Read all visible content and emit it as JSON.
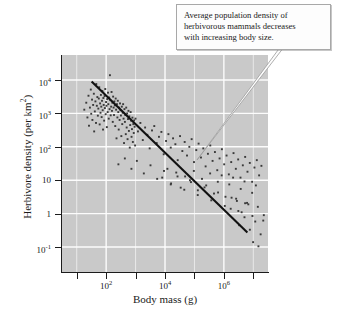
{
  "figure": {
    "panel_color": "#c9c9c9",
    "grid_color": "#ffffff",
    "point_color": "#3a3a3a",
    "line_color": "#111111"
  },
  "callout": {
    "text": "Average population density of herbivorous mammals decreases with increasing body size.",
    "line1": "Average population density of",
    "line2": "herbivorous mammals decreases",
    "line3": "with increasing body size."
  },
  "chart_data": {
    "type": "scatter",
    "title": "",
    "xlabel": "Body mass (g)",
    "ylabel": "Herbivore density (per km²)",
    "xscale": "log",
    "yscale": "log",
    "xlim": [
      3.16,
      31600000
    ],
    "ylim": [
      0.0178,
      56200
    ],
    "grid": true,
    "legend": null,
    "xticks": [
      100,
      10000,
      1000000
    ],
    "xticklabels": [
      "10²",
      "10⁴",
      "10⁶"
    ],
    "xtick_exponents": [
      "2",
      "4",
      "6"
    ],
    "yticks": [
      10000,
      1000,
      100,
      10,
      1,
      0.1
    ],
    "yticklabels": [
      "10⁴",
      "10³",
      "10²",
      "10",
      "1",
      "10⁻¹"
    ],
    "ytick_mantissas": [
      "10",
      "10",
      "10",
      "10",
      "1",
      "10"
    ],
    "ytick_exponents": [
      "4",
      "3",
      "2",
      "",
      "",
      "-1"
    ],
    "annotations": [
      {
        "text": "Average population density of herbivorous mammals decreases with increasing body size.",
        "type": "callout-box",
        "pointer_target_x": 300000,
        "pointer_target_y": 30
      }
    ],
    "trendline": {
      "type": "power-law regression",
      "x_start": 32,
      "y_start": 9000,
      "x_end": 6300000,
      "y_end": 0.27,
      "slope_log10": -0.75
    },
    "n_points": 204,
    "points": [
      [
        18,
        1300
      ],
      [
        21,
        2100
      ],
      [
        23,
        760
      ],
      [
        25,
        3400
      ],
      [
        26,
        430
      ],
      [
        28,
        1500
      ],
      [
        30,
        5200
      ],
      [
        31,
        980
      ],
      [
        33,
        2600
      ],
      [
        34,
        640
      ],
      [
        36,
        1800
      ],
      [
        38,
        3900
      ],
      [
        39,
        290
      ],
      [
        41,
        1150
      ],
      [
        43,
        2300
      ],
      [
        45,
        520
      ],
      [
        46,
        7600
      ],
      [
        48,
        1700
      ],
      [
        50,
        3100
      ],
      [
        52,
        860
      ],
      [
        54,
        1400
      ],
      [
        56,
        2800
      ],
      [
        58,
        6100
      ],
      [
        60,
        470
      ],
      [
        62,
        2000
      ],
      [
        64,
        1050
      ],
      [
        66,
        3600
      ],
      [
        68,
        1600
      ],
      [
        70,
        780
      ],
      [
        72,
        2400
      ],
      [
        74,
        4700
      ],
      [
        76,
        1250
      ],
      [
        78,
        330
      ],
      [
        80,
        2900
      ],
      [
        82,
        1800
      ],
      [
        85,
        610
      ],
      [
        88,
        3300
      ],
      [
        90,
        1450
      ],
      [
        93,
        5400
      ],
      [
        96,
        950
      ],
      [
        99,
        2200
      ],
      [
        102,
        1700
      ],
      [
        105,
        390
      ],
      [
        108,
        2700
      ],
      [
        112,
        1100
      ],
      [
        115,
        4200
      ],
      [
        118,
        1900
      ],
      [
        122,
        700
      ],
      [
        126,
        3000
      ],
      [
        130,
        1350
      ],
      [
        134,
        14000
      ],
      [
        138,
        2500
      ],
      [
        142,
        880
      ],
      [
        147,
        1600
      ],
      [
        152,
        4400
      ],
      [
        157,
        1200
      ],
      [
        162,
        2100
      ],
      [
        167,
        560
      ],
      [
        172,
        3200
      ],
      [
        178,
        1500
      ],
      [
        184,
        900
      ],
      [
        190,
        2300
      ],
      [
        196,
        1750
      ],
      [
        203,
        420
      ],
      [
        210,
        2800
      ],
      [
        217,
        1300
      ],
      [
        224,
        180
      ],
      [
        232,
        1900
      ],
      [
        240,
        760
      ],
      [
        248,
        2400
      ],
      [
        257,
        1100
      ],
      [
        266,
        330
      ],
      [
        275,
        1500
      ],
      [
        285,
        640
      ],
      [
        295,
        2000
      ],
      [
        305,
        1250
      ],
      [
        316,
        870
      ],
      [
        327,
        210
      ],
      [
        339,
        1600
      ],
      [
        351,
        480
      ],
      [
        363,
        1050
      ],
      [
        376,
        1900
      ],
      [
        389,
        700
      ],
      [
        403,
        130
      ],
      [
        417,
        1350
      ],
      [
        432,
        560
      ],
      [
        447,
        900
      ],
      [
        463,
        240
      ],
      [
        479,
        1500
      ],
      [
        496,
        380
      ],
      [
        514,
        1000
      ],
      [
        532,
        170
      ],
      [
        550,
        680
      ],
      [
        570,
        1200
      ],
      [
        590,
        300
      ],
      [
        611,
        820
      ],
      [
        632,
        95
      ],
      [
        654,
        450
      ],
      [
        677,
        1100
      ],
      [
        701,
        610
      ],
      [
        726,
        200
      ],
      [
        751,
        340
      ],
      [
        778,
        750
      ],
      [
        805,
        140
      ],
      [
        834,
        480
      ],
      [
        863,
        260
      ],
      [
        894,
        620
      ],
      [
        925,
        400
      ],
      [
        958,
        110
      ],
      [
        992,
        700
      ],
      [
        1200,
        290
      ],
      [
        1450,
        520
      ],
      [
        1750,
        160
      ],
      [
        2100,
        380
      ],
      [
        2500,
        230
      ],
      [
        3000,
        90
      ],
      [
        3600,
        310
      ],
      [
        4300,
        420
      ],
      [
        5200,
        130
      ],
      [
        6200,
        200
      ],
      [
        7500,
        280
      ],
      [
        9000,
        60
      ],
      [
        10800,
        150
      ],
      [
        13000,
        240
      ],
      [
        15600,
        95
      ],
      [
        18700,
        180
      ],
      [
        22400,
        120
      ],
      [
        26900,
        40
      ],
      [
        32300,
        210
      ],
      [
        38700,
        75
      ],
      [
        46400,
        140
      ],
      [
        55700,
        55
      ],
      [
        66800,
        100
      ],
      [
        80100,
        170
      ],
      [
        96100,
        35
      ],
      [
        115000,
        80
      ],
      [
        138000,
        125
      ],
      [
        166000,
        48
      ],
      [
        199000,
        90
      ],
      [
        239000,
        26
      ],
      [
        286000,
        62
      ],
      [
        344000,
        110
      ],
      [
        412000,
        38
      ],
      [
        495000,
        70
      ],
      [
        594000,
        20
      ],
      [
        712000,
        45
      ],
      [
        854000,
        85
      ],
      [
        1020000,
        30
      ],
      [
        1230000,
        55
      ],
      [
        1470000,
        15
      ],
      [
        1770000,
        35
      ],
      [
        2120000,
        65
      ],
      [
        2540000,
        22
      ],
      [
        3050000,
        42
      ],
      [
        3660000,
        12
      ],
      [
        4390000,
        28
      ],
      [
        5270000,
        50
      ],
      [
        6320000,
        18
      ],
      [
        7580000,
        33
      ],
      [
        9100000,
        9
      ],
      [
        10900000,
        24
      ],
      [
        13100000,
        40
      ],
      [
        15700000,
        14
      ],
      [
        18800000,
        27
      ],
      [
        8000,
        12
      ],
      [
        12000,
        22
      ],
      [
        16000,
        8
      ],
      [
        24000,
        17
      ],
      [
        34000,
        6
      ],
      [
        48000,
        13
      ],
      [
        70000,
        10
      ],
      [
        95000,
        19
      ],
      [
        130000,
        5
      ],
      [
        180000,
        11
      ],
      [
        250000,
        7
      ],
      [
        340000,
        16
      ],
      [
        460000,
        4
      ],
      [
        620000,
        9
      ],
      [
        840000,
        14
      ],
      [
        1130000,
        3.2
      ],
      [
        1520000,
        7.5
      ],
      [
        2050000,
        12
      ],
      [
        2760000,
        2.4
      ],
      [
        3720000,
        5.5
      ],
      [
        5010000,
        9.2
      ],
      [
        6750000,
        1.9
      ],
      [
        9100000,
        4.2
      ],
      [
        12200000,
        7
      ],
      [
        1700000,
        1.4
      ],
      [
        2600000,
        2.8
      ],
      [
        4000000,
        1.1
      ],
      [
        6100000,
        2.1
      ],
      [
        9300000,
        0.85
      ],
      [
        14200000,
        1.6
      ],
      [
        21700000,
        0.62
      ],
      [
        3300000,
        0.45
      ],
      [
        5000000,
        0.78
      ],
      [
        7600000,
        0.33
      ],
      [
        11600000,
        0.58
      ],
      [
        17700000,
        0.24
      ],
      [
        9800000,
        0.14
      ],
      [
        14900000,
        0.105
      ],
      [
        22700000,
        0.9
      ],
      [
        260,
        30
      ],
      [
        430,
        45
      ],
      [
        720,
        22
      ],
      [
        1100,
        38
      ],
      [
        1900,
        16
      ],
      [
        3200,
        28
      ],
      [
        5400,
        11
      ],
      [
        9200,
        19
      ],
      [
        15600,
        7.5
      ],
      [
        26500,
        13
      ],
      [
        45000,
        5.2
      ],
      [
        76000,
        8.8
      ],
      [
        129000,
        3.6
      ],
      [
        219000,
        6.1
      ],
      [
        372000,
        2.5
      ],
      [
        632000,
        4.3
      ],
      [
        1070000,
        1.7
      ],
      [
        1820000,
        3
      ],
      [
        3090000,
        1.2
      ],
      [
        5250000,
        2.05
      ]
    ]
  }
}
